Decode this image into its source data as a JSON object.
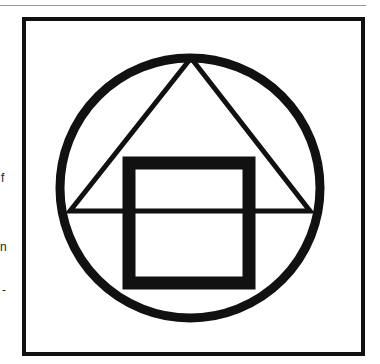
{
  "page": {
    "margin_fragments": [
      {
        "text": "f",
        "y": 178
      },
      {
        "text": "n",
        "y": 247
      },
      {
        "text": "-",
        "y": 290
      }
    ]
  },
  "figure": {
    "stroke_color": "#111111",
    "background": "#ffffff",
    "frame": {
      "x": 24,
      "y": 19,
      "width": 339,
      "height": 335,
      "stroke_width": 4
    },
    "circle": {
      "cx": 190,
      "cy": 188,
      "r": 130,
      "stroke_width": 9
    },
    "triangle": {
      "apex": [
        191,
        58
      ],
      "base_left": [
        70,
        211
      ],
      "base_right": [
        310,
        211
      ],
      "stroke_width": 5
    },
    "square": {
      "x": 129,
      "y": 163,
      "width": 120,
      "height": 120,
      "stroke_width": 13
    }
  }
}
